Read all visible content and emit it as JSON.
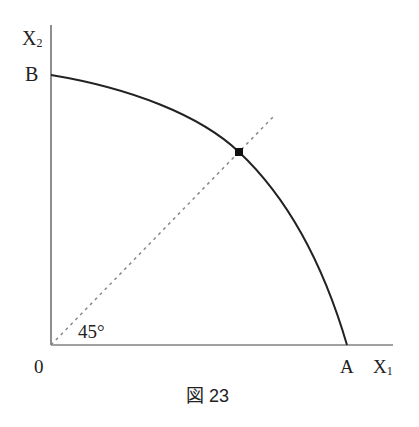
{
  "diagram": {
    "y_axis_label": "X",
    "y_axis_sub": "2",
    "x_axis_label": "X",
    "x_axis_sub": "1",
    "origin_label": "0",
    "point_b_label": "B",
    "point_a_label": "A",
    "angle_label": "45°",
    "caption": "図 23"
  }
}
